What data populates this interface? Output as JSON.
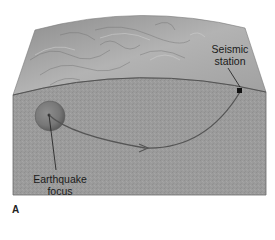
{
  "diagram": {
    "panel_label": "A",
    "labels": {
      "station_line1": "Seismic",
      "station_line2": "station",
      "focus_line1": "Earthquake",
      "focus_line2": "focus"
    },
    "colors": {
      "surface_relief": "#a9a9a9",
      "crust_section": "#9a9a9a",
      "focus_sphere": "#7a7a7a",
      "wave_path": "#555555",
      "leader_line": "#1a1a1a",
      "station_marker": "#111111"
    }
  }
}
